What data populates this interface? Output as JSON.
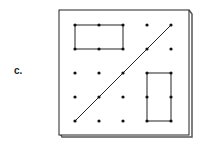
{
  "label": "c.",
  "geoboard": {
    "grid_size": [
      5,
      5
    ],
    "rectangles": [
      {
        "name": "top-left-rectangle",
        "from": [
          0,
          0
        ],
        "to": [
          2,
          1
        ]
      },
      {
        "name": "bottom-right-rectangle",
        "from": [
          3,
          2
        ],
        "to": [
          4,
          4
        ]
      }
    ],
    "segments": [
      {
        "name": "diagonal-line",
        "from": [
          0,
          4
        ],
        "to": [
          4,
          0
        ]
      }
    ]
  }
}
